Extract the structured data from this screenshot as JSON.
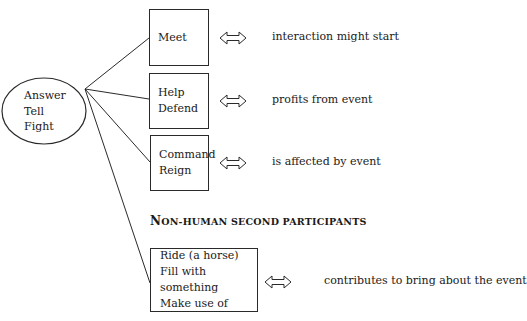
{
  "ellipse": {
    "lines": [
      "Answer",
      "Tell",
      "Fight"
    ]
  },
  "rows": [
    {
      "box_lines": [
        "Meet"
      ],
      "description": "interaction might start"
    },
    {
      "box_lines": [
        "Help",
        "Defend"
      ],
      "description": "profits from event"
    },
    {
      "box_lines": [
        "Command",
        "Reign"
      ],
      "description": "is affected by event"
    },
    {
      "box_lines": [
        "Ride (a horse)",
        "Fill with something",
        "Make use of"
      ],
      "description": "contributes to bring about the event"
    }
  ],
  "section_heading": {
    "first_letter": "N",
    "rest": "ON-HUMAN SECOND PARTICIPANTS"
  },
  "arrow_icon": "double-headed-arrow-icon",
  "colors": {
    "line": "#2a2a2a",
    "text": "#1a1a1a",
    "background": "#ffffff"
  }
}
